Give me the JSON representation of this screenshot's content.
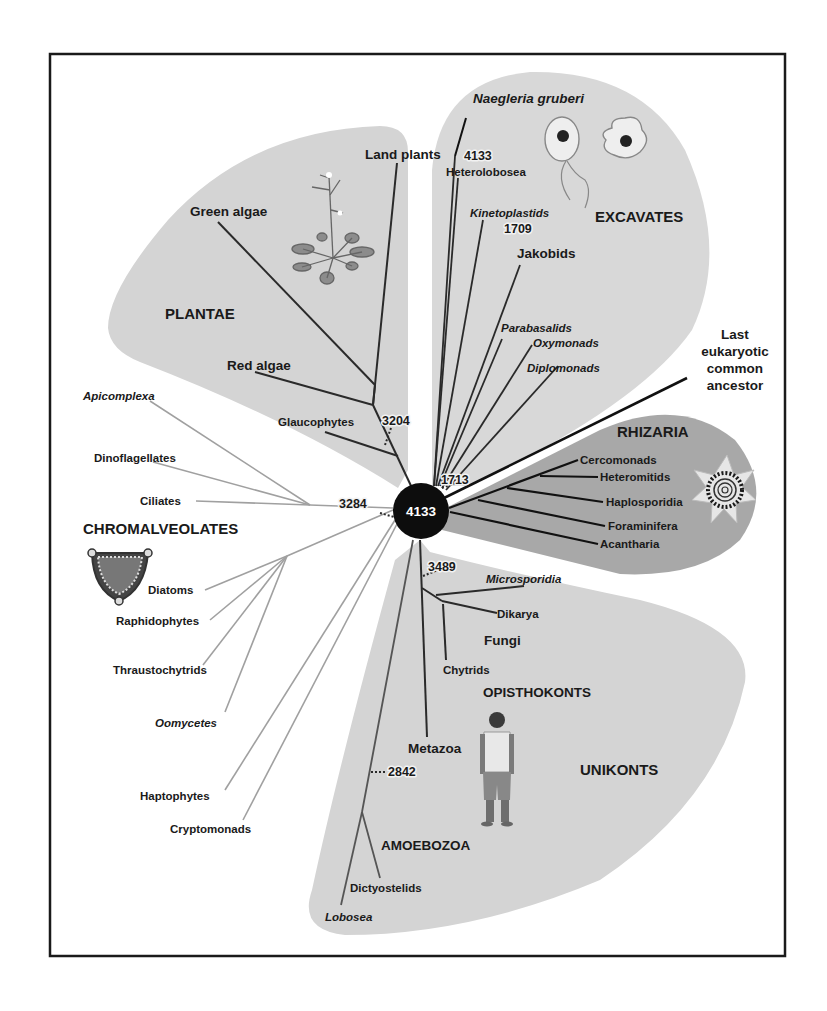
{
  "figure": {
    "colors": {
      "background": "#ffffff",
      "frame": "#1a1a1a",
      "region_light": "#d4d4d4",
      "region_rhizaria": "#a8a8a8",
      "branch_dark": "#2a2a2a",
      "branch_light": "#a0a0a0",
      "root_node": "#0d0d0d"
    },
    "root": {
      "label": "4133"
    },
    "ancestor_label": [
      "Last",
      "eukaryotic",
      "common",
      "ancestor"
    ],
    "supergroups": {
      "plantae": {
        "name": "PLANTAE",
        "node_count": "3204",
        "taxa": [
          "Land plants",
          "Green algae",
          "Red algae",
          "Glaucophytes"
        ],
        "icon": "plant-icon"
      },
      "excavates": {
        "name": "EXCAVATES",
        "node_count": "1713",
        "species_label": "Naegleria gruberi",
        "species_count": "4133",
        "taxa": [
          "Heterolobosea",
          "Kinetoplastids",
          "Jakobids",
          "Parabasalids",
          "Oxymonads",
          "Diplomonads"
        ],
        "kinetoplastids_count": "1709",
        "icon": "naegleria-cell-icon"
      },
      "rhizaria": {
        "name": "RHIZARIA",
        "taxa": [
          "Cercomonads",
          "Heteromitids",
          "Haplosporidia",
          "Foraminifera",
          "Acantharia"
        ],
        "icon": "radiolarian-star-icon"
      },
      "chromalveolates": {
        "name": "CHROMALVEOLATES",
        "node_count": "3284",
        "taxa": [
          "Apicomplexa",
          "Dinoflagellates",
          "Ciliates",
          "Diatoms",
          "Raphidophytes",
          "Thraustochytrids",
          "Oomycetes",
          "Haptophytes",
          "Cryptomonads"
        ],
        "icon": "diatom-icon"
      },
      "unikonts": {
        "name": "UNIKONTS",
        "opisthokonts": {
          "name": "OPISTHOKONTS",
          "node_count": "3489",
          "fungi_label": "Fungi",
          "taxa": [
            "Microsporidia",
            "Dikarya",
            "Chytrids",
            "Metazoa"
          ]
        },
        "amoebozoa": {
          "name": "AMOEBOZOA",
          "node_count": "2842",
          "taxa": [
            "Dictyostelids",
            "Lobosea"
          ]
        },
        "icon": "human-figure-icon"
      }
    }
  }
}
